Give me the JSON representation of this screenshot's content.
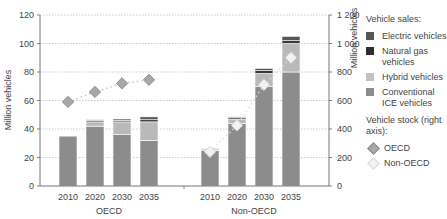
{
  "chart_data": {
    "type": "bar",
    "subtype": "stacked-bar-with-line-overlay",
    "title": "",
    "left_axis": {
      "label": "Million vehicles",
      "min": 0,
      "max": 120,
      "ticks": [
        "0",
        "20",
        "40",
        "60",
        "80",
        "100",
        "120"
      ]
    },
    "right_axis": {
      "label": "Million vehicles",
      "min": 0,
      "max": 1200,
      "ticks": [
        "0",
        "200",
        "400",
        "600",
        "800",
        "1 000",
        "1 200"
      ]
    },
    "groups": [
      {
        "name": "OECD",
        "categories": [
          "2010",
          "2020",
          "2030",
          "2035"
        ]
      },
      {
        "name": "Non-OECD",
        "categories": [
          "2010",
          "2020",
          "2030",
          "2035"
        ]
      }
    ],
    "series": [
      {
        "name": "Conventional ICE vehicles",
        "color": "#8c8c8c",
        "axis": "left",
        "values": {
          "OECD": [
            35,
            42,
            36,
            32
          ],
          "Non-OECD": [
            25,
            44,
            70,
            80
          ]
        }
      },
      {
        "name": "Hybrid vehicles",
        "color": "#b9b9b9",
        "axis": "left",
        "values": {
          "OECD": [
            0,
            3,
            9,
            13
          ],
          "Non-OECD": [
            1,
            3,
            9,
            20
          ]
        }
      },
      {
        "name": "Natural gas vehicles",
        "color": "#3a3a3a",
        "axis": "left",
        "values": {
          "OECD": [
            0,
            1,
            1,
            1.5
          ],
          "Non-OECD": [
            0.5,
            1,
            2,
            2
          ]
        }
      },
      {
        "name": "Electric vehicles",
        "color": "#555555",
        "axis": "left",
        "values": {
          "OECD": [
            0,
            0.5,
            1,
            2
          ],
          "Non-OECD": [
            0,
            0.5,
            1.5,
            3
          ]
        }
      }
    ],
    "line_series": [
      {
        "name": "OECD",
        "axis": "right",
        "marker": "diamond",
        "color": "#a8a8a8",
        "style": "dotted",
        "x": [
          "2010",
          "2020",
          "2030",
          "2035"
        ],
        "values": [
          590,
          660,
          720,
          745
        ]
      },
      {
        "name": "Non-OECD",
        "axis": "right",
        "marker": "diamond",
        "color": "#ececec",
        "style": "dotted",
        "x": [
          "2010",
          "2020",
          "2030",
          "2035"
        ],
        "values": [
          240,
          425,
          710,
          900
        ]
      }
    ],
    "grid": true,
    "legend_position": "right"
  },
  "labels": {
    "left_axis_title": "Million vehicles",
    "right_axis_title": "Million vehicles",
    "group_oecd": "OECD",
    "group_nonoecd": "Non-OECD"
  },
  "legend": {
    "sales_title": "Vehicle sales:",
    "sales_items": [
      {
        "label": "Electric vehicles",
        "color": "#555555"
      },
      {
        "label": "Natural gas vehicles",
        "color": "#2e2e2e"
      },
      {
        "label": "Hybrid vehicles",
        "color": "#c2c2c2"
      },
      {
        "label": "Conventional ICE vehicles",
        "color": "#8c8c8c"
      }
    ],
    "stock_title": "Vehicle stock (right axis):",
    "stock_items": [
      {
        "label": "OECD",
        "fill": "#a8a8a8",
        "stroke": "#888888"
      },
      {
        "label": "Non-OECD",
        "fill": "#f2f2f2",
        "stroke": "#d8d8d8"
      }
    ]
  }
}
